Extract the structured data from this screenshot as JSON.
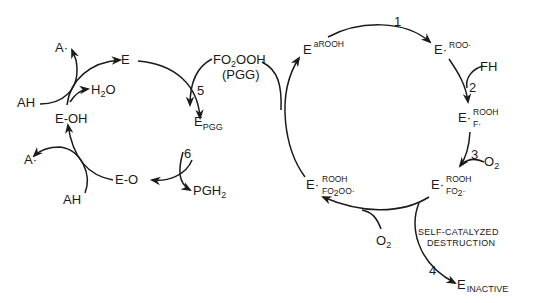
{
  "left_cycle": {
    "E": "E",
    "E_PGG": "E",
    "E_PGG_sub": "PGG",
    "E_O": "E-O",
    "E_OH": "E-OH",
    "AH_top": "AH",
    "A_radical_top": "A·",
    "H2O_H": "H",
    "H2O_2": "2",
    "H2O_O": "O",
    "AH_bottom": "AH",
    "A_radical_bottom": "A·",
    "step5": "5",
    "step6": "6",
    "PGH2_main": "PGH",
    "PGH2_sub": "2"
  },
  "substrate": {
    "line1_a": "FO",
    "line1_sub": "2",
    "line1_b": "OOH",
    "line2": "(PGG)"
  },
  "right_cycle": {
    "E_aROOH": "E",
    "E_aROOH_sup": "aROOH",
    "E_ROO": "E·",
    "E_ROO_sup": "ROO·",
    "FH": "FH",
    "E_F": "E·",
    "E_F_sup": "ROOH",
    "E_F_sub": "F·",
    "O2_top_O": "O",
    "O2_top_2": "2",
    "E_FO2": "E·",
    "E_FO2_sup": "ROOH",
    "E_FO2_sub_a": "FO",
    "E_FO2_sub_2": "2",
    "E_FO2_sub_b": "·",
    "E_FO2OO": "E·",
    "E_FO2OO_sup": "ROOH",
    "E_FO2OO_sub_a": "FO",
    "E_FO2OO_sub_2": "2",
    "E_FO2OO_sub_b": "OO·",
    "O2_bottom_O": "O",
    "O2_bottom_2": "2",
    "self_catalyzed_1": "SELF-CATALYZED",
    "self_catalyzed_2": "DESTRUCTION",
    "E_inactive": "E",
    "E_inactive_sub": "INACTIVE",
    "step1": "1",
    "step2": "2",
    "step3": "3",
    "step4": "4"
  }
}
